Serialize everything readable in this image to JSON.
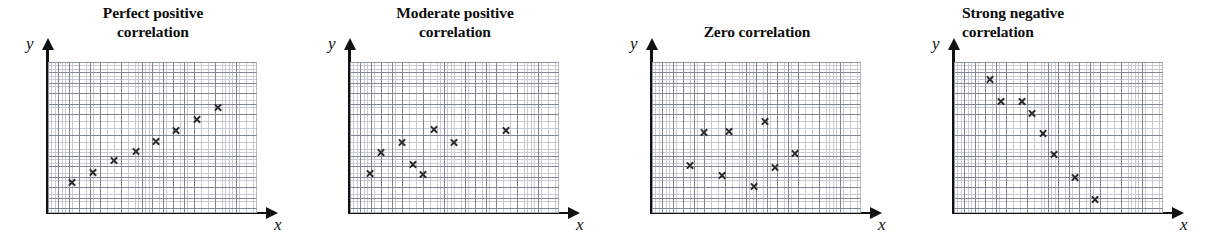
{
  "figure": {
    "axis_labels": {
      "x": "x",
      "y": "y"
    },
    "marker_glyph": "x-marker",
    "colors": {
      "axis": "#111111",
      "grid_major": "#7f8694",
      "grid_minor": "#c7ccd4",
      "marker": "#2b2b2b",
      "title_text": "#0d0d0d",
      "background": "#ffffff"
    }
  },
  "chart_data": [
    {
      "type": "scatter",
      "title": "Perfect positive\ncorrelation",
      "title_lines": [
        "Perfect positive",
        "correlation"
      ],
      "xlabel": "x",
      "ylabel": "y",
      "grid": true,
      "legend": "none",
      "xlim": [
        0,
        20
      ],
      "ylim": [
        0,
        14.5
      ],
      "points": [
        {
          "x": 2.3,
          "y": 2.9
        },
        {
          "x": 4.3,
          "y": 3.9
        },
        {
          "x": 6.3,
          "y": 5.0
        },
        {
          "x": 8.4,
          "y": 5.9
        },
        {
          "x": 10.3,
          "y": 6.9
        },
        {
          "x": 12.3,
          "y": 7.9
        },
        {
          "x": 14.3,
          "y": 9.0
        },
        {
          "x": 16.3,
          "y": 10.1
        }
      ]
    },
    {
      "type": "scatter",
      "title": "Moderate positive\ncorrelation",
      "title_lines": [
        "Moderate positive",
        "correlation"
      ],
      "xlabel": "x",
      "ylabel": "y",
      "grid": true,
      "legend": "none",
      "xlim": [
        0,
        20
      ],
      "ylim": [
        0,
        14.5
      ],
      "points": [
        {
          "x": 1.9,
          "y": 3.8
        },
        {
          "x": 3.0,
          "y": 5.8
        },
        {
          "x": 5.0,
          "y": 6.8
        },
        {
          "x": 6.0,
          "y": 4.7
        },
        {
          "x": 7.0,
          "y": 3.7
        },
        {
          "x": 8.0,
          "y": 8.0
        },
        {
          "x": 10.0,
          "y": 6.8
        },
        {
          "x": 14.9,
          "y": 7.9
        }
      ]
    },
    {
      "type": "scatter",
      "title": "Zero correlation",
      "title_lines": [
        "Zero correlation"
      ],
      "xlabel": "x",
      "ylabel": "y",
      "grid": true,
      "legend": "none",
      "xlim": [
        0,
        20
      ],
      "ylim": [
        0,
        14.5
      ],
      "points": [
        {
          "x": 3.6,
          "y": 4.6
        },
        {
          "x": 5.0,
          "y": 7.7
        },
        {
          "x": 6.7,
          "y": 3.6
        },
        {
          "x": 7.4,
          "y": 7.8
        },
        {
          "x": 9.8,
          "y": 2.5
        },
        {
          "x": 10.8,
          "y": 8.8
        },
        {
          "x": 11.8,
          "y": 4.4
        },
        {
          "x": 13.7,
          "y": 5.7
        }
      ]
    },
    {
      "type": "scatter",
      "title": "Strong negative\ncorrelation",
      "title_lines": [
        "Strong negative",
        "correlation"
      ],
      "xlabel": "x",
      "ylabel": "y",
      "grid": true,
      "legend": "none",
      "xlim": [
        0,
        20
      ],
      "ylim": [
        0,
        14.5
      ],
      "points": [
        {
          "x": 3.5,
          "y": 12.8
        },
        {
          "x": 4.5,
          "y": 10.7
        },
        {
          "x": 6.5,
          "y": 10.7
        },
        {
          "x": 7.5,
          "y": 9.6
        },
        {
          "x": 8.5,
          "y": 7.6
        },
        {
          "x": 9.6,
          "y": 5.6
        },
        {
          "x": 11.6,
          "y": 3.4
        },
        {
          "x": 13.5,
          "y": 1.3
        }
      ]
    }
  ]
}
